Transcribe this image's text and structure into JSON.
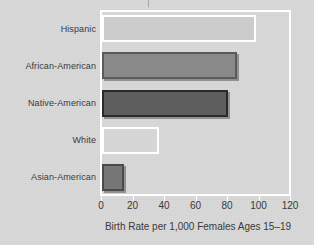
{
  "chart_data": {
    "type": "bar",
    "orientation": "horizontal",
    "title": "",
    "xlabel": "Birth Rate per 1,000 Females Ages 15–19",
    "ylabel": "",
    "categories": [
      "Hispanic",
      "African-American",
      "Native-American",
      "White",
      "Asian-American"
    ],
    "values": [
      98,
      86,
      80,
      36,
      14
    ],
    "xlim": [
      0,
      120
    ],
    "xticks": [
      0,
      20,
      40,
      60,
      80,
      100,
      120
    ],
    "xticklabels": [
      "0",
      "20",
      "40",
      "60",
      "80",
      "100",
      "120"
    ],
    "grid": false,
    "legend": "none",
    "bar_fills": [
      "#cccccc",
      "#898989",
      "#5e5e5e",
      "#d6d6d6",
      "#777777"
    ],
    "bar_edges": [
      "#ffffff",
      "#5a5a5a",
      "#2a2a2a",
      "#ffffff",
      "#4a4a4a"
    ],
    "background_color": "#d9d9d9",
    "frame_color": "#ffffff",
    "text_color": "#3a3a3a"
  },
  "axis": {
    "x_title": "Birth Rate per 1,000 Females Ages 15–19"
  }
}
